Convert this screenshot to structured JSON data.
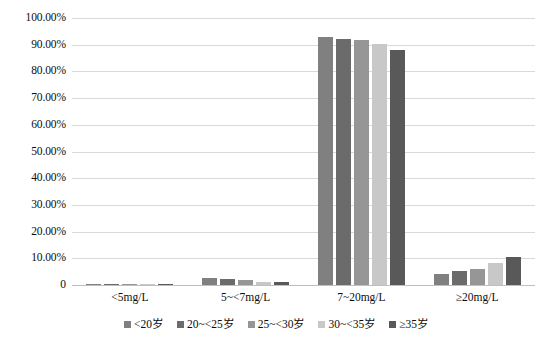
{
  "chart_data": {
    "type": "bar",
    "title": "",
    "subtitle": "",
    "xlabel": "",
    "ylabel": "",
    "categories": [
      "<5mg/L",
      "5~<7mg/L",
      "7~20mg/L",
      "≥20mg/L"
    ],
    "series": [
      {
        "name": "<20岁",
        "color": "#808080",
        "values": [
          0.2,
          2.6,
          93.0,
          4.2
        ]
      },
      {
        "name": "20~<25岁",
        "color": "#6b6b6b",
        "values": [
          0.25,
          2.3,
          92.3,
          5.15
        ]
      },
      {
        "name": "25~<30岁",
        "color": "#969696",
        "values": [
          0.2,
          1.9,
          91.8,
          6.1
        ]
      },
      {
        "name": "30~<35岁",
        "color": "#c8c8c8",
        "values": [
          0.15,
          1.2,
          90.4,
          8.25
        ]
      },
      {
        "name": "≥35岁",
        "color": "#595959",
        "values": [
          0.2,
          1.3,
          88.0,
          10.5
        ]
      }
    ],
    "ylim": [
      0,
      100
    ],
    "ytick_labels": [
      "100.00%",
      "90.00%",
      "80.00%",
      "70.00%",
      "60.00%",
      "50.00%",
      "40.00%",
      "30.00%",
      "20.00%",
      "10.00%",
      "0"
    ],
    "ytick_values": [
      100,
      90,
      80,
      70,
      60,
      50,
      40,
      30,
      20,
      10,
      0
    ],
    "grid": true,
    "legend_position": "bottom",
    "gridline_color": "#d9d9d9",
    "axis_color": "#bfbfbf",
    "background": "#ffffff"
  }
}
